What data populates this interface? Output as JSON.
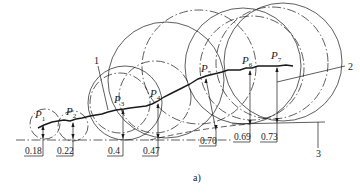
{
  "figure": {
    "caption": "a)",
    "callouts": [
      {
        "id": "1",
        "label": "1"
      },
      {
        "id": "2",
        "label": "2"
      },
      {
        "id": "3",
        "label": "3"
      }
    ],
    "points": [
      {
        "name": "P",
        "sub": "1",
        "value": "0.18"
      },
      {
        "name": "P",
        "sub": "2",
        "value": "0.22"
      },
      {
        "name": "P",
        "sub": "3",
        "value": "0.4"
      },
      {
        "name": "P",
        "sub": "4",
        "value": "0.47"
      },
      {
        "name": "P",
        "sub": "5",
        "value": "0.70"
      },
      {
        "name": "P",
        "sub": "6",
        "value": "0.69"
      },
      {
        "name": "P",
        "sub": "7",
        "value": "0.73"
      }
    ]
  }
}
